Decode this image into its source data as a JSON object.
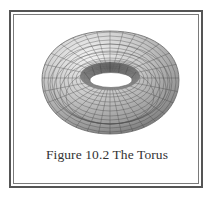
{
  "figure": {
    "caption": "Figure 10.2 The Torus",
    "colors": {
      "frame_outer": "#555555",
      "frame_inner": "#7a7a7a",
      "surface_light": "#e6e6e6",
      "surface_dark": "#6e6e6e",
      "mesh_lines": "#3a3a3a"
    }
  }
}
